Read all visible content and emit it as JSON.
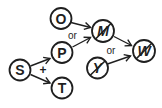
{
  "diagram": {
    "background_color": "#ffffff",
    "ink_color": "#1f1f1f",
    "nodes": {
      "O": {
        "label": "O",
        "crossed_out": false
      },
      "P": {
        "label": "P",
        "crossed_out": false
      },
      "S": {
        "label": "S",
        "crossed_out": false
      },
      "T": {
        "label": "T",
        "crossed_out": false
      },
      "M": {
        "label": "M",
        "crossed_out": true
      },
      "Y": {
        "label": "Y",
        "crossed_out": true
      },
      "W": {
        "label": "W",
        "crossed_out": true
      }
    },
    "edges": [
      {
        "from": "O",
        "to": "M"
      },
      {
        "from": "P",
        "to": "M"
      },
      {
        "from": "S",
        "to": "P"
      },
      {
        "from": "S",
        "to": "T"
      },
      {
        "from": "M",
        "to": "W"
      },
      {
        "from": "Y",
        "to": "W"
      }
    ],
    "labels": {
      "or_upper": "or",
      "plus": "+",
      "or_lower": "or"
    }
  }
}
